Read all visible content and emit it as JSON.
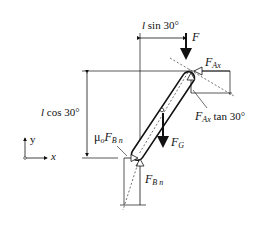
{
  "diagram": {
    "type": "free-body diagram",
    "labels": {
      "l_sin": {
        "var": "l",
        "text": " sin 30°"
      },
      "l_cos": {
        "var": "l",
        "text": " cos 30°"
      },
      "F": "F",
      "F_Ax": {
        "main": "F",
        "sub": "Ax"
      },
      "F_Ax_tan": {
        "main": "F",
        "sub": "Ax",
        "suffix": " tan 30°"
      },
      "F_G": {
        "main": "F",
        "sub": "G"
      },
      "mu_F_Bn": {
        "mu": "μ",
        "mu_sub": "o",
        "main": "F",
        "sub": "B n"
      },
      "F_Bn": {
        "main": "F",
        "sub": "B n"
      },
      "axis_y": "y",
      "axis_x": "x"
    },
    "angle_deg": 30,
    "colors": {
      "ink": "#111111",
      "background": "#ffffff"
    }
  }
}
